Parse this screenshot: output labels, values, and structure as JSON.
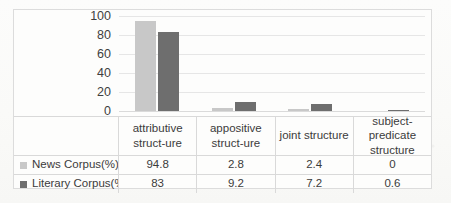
{
  "chart_data": {
    "type": "bar",
    "title": "",
    "xlabel": "",
    "ylabel": "",
    "ylim": [
      0,
      100
    ],
    "yticks": [
      100,
      80,
      60,
      40,
      20,
      0
    ],
    "grid": true,
    "legend_position": "table-left-column",
    "categories": [
      "attributive struct-ure",
      "appositive struct-ure",
      "joint structure",
      "subject-predicate structure"
    ],
    "category_lines": [
      [
        "attributive",
        "struct-ure"
      ],
      [
        "appositive",
        "struct-ure"
      ],
      [
        "joint structure"
      ],
      [
        "subject-",
        "predicate",
        "structure"
      ]
    ],
    "series": [
      {
        "name": "News Corpus(%)",
        "color": "#c8c8c8",
        "values": [
          94.8,
          2.8,
          2.4,
          0
        ],
        "value_labels": [
          "94.8",
          "2.8",
          "2.4",
          "0"
        ]
      },
      {
        "name": "Literary Corpus(%)",
        "color": "#6e6e6e",
        "values": [
          83,
          9.2,
          7.2,
          0.6
        ],
        "value_labels": [
          "83",
          "9.2",
          "7.2",
          "0.6"
        ]
      }
    ]
  },
  "colors": {
    "series_news": "#c8c8c8",
    "series_literary": "#6e6e6e",
    "gridline": "#e6e6e6",
    "border": "#d9d9d9",
    "text": "#3b3b3b",
    "page_background": "#fbfbfa"
  }
}
